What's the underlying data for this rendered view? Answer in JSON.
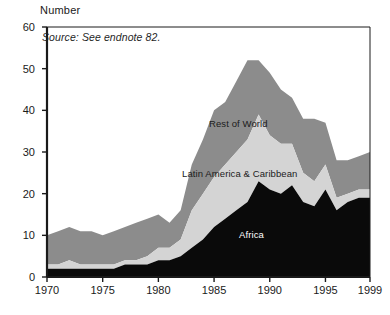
{
  "chart_data": {
    "type": "area",
    "stacked": true,
    "title": "",
    "subtitle": "",
    "xlabel": "",
    "ylabel": "Number",
    "unit_label": "Number",
    "source_note": "Source: See endnote 82.",
    "xlim": [
      1970,
      1999
    ],
    "ylim": [
      0,
      60
    ],
    "ytick_values": [
      0,
      10,
      20,
      30,
      40,
      50,
      60
    ],
    "ytick_labels": [
      "0",
      "10",
      "20",
      "30",
      "40",
      "50",
      "60"
    ],
    "xtick_values": [
      1970,
      1975,
      1980,
      1985,
      1990,
      1995,
      1999
    ],
    "xtick_labels": [
      "1970",
      "1975",
      "1980",
      "1985",
      "1990",
      "1995",
      "1999"
    ],
    "grid": false,
    "legend_position": "inline-annotations",
    "x": [
      1970,
      1971,
      1972,
      1973,
      1974,
      1975,
      1976,
      1977,
      1978,
      1979,
      1980,
      1981,
      1982,
      1983,
      1984,
      1985,
      1986,
      1987,
      1988,
      1989,
      1990,
      1991,
      1992,
      1993,
      1994,
      1995,
      1996,
      1997,
      1998,
      1999
    ],
    "series": [
      {
        "name": "Africa",
        "color": "#0a0a0a",
        "values": [
          2,
          2,
          2,
          2,
          2,
          2,
          2,
          3,
          3,
          3,
          4,
          4,
          5,
          7,
          9,
          12,
          14,
          16,
          18,
          23,
          21,
          20,
          22,
          18,
          17,
          21,
          16,
          18,
          19,
          19
        ]
      },
      {
        "name": "Latin America & Caribbean",
        "color": "#d4d4d4",
        "values": [
          1,
          1,
          2,
          1,
          1,
          1,
          1,
          1,
          1,
          2,
          3,
          3,
          4,
          9,
          11,
          12,
          13,
          14,
          15,
          16,
          13,
          12,
          10,
          7,
          6,
          6,
          3,
          2,
          2,
          2
        ]
      },
      {
        "name": "Rest of World",
        "color": "#8c8c8c",
        "values": [
          7,
          8,
          8,
          8,
          8,
          7,
          8,
          8,
          9,
          9,
          8,
          6,
          7,
          11,
          13,
          16,
          15,
          17,
          19,
          13,
          15,
          13,
          11,
          13,
          15,
          10,
          9,
          8,
          8,
          9
        ]
      }
    ],
    "annotations": [
      {
        "text": "Rest of World",
        "x_px": 209,
        "y_px": 118
      },
      {
        "text": "Latin America & Caribbean",
        "x_px": 182,
        "y_px": 168
      },
      {
        "text": "Africa",
        "x_px": 239,
        "y_px": 229
      }
    ]
  }
}
